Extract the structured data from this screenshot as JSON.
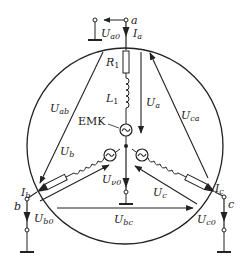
{
  "diagram": {
    "type": "three-phase star (wye) generator circuit",
    "colors": {
      "stroke": "#222222",
      "background": "#ffffff"
    },
    "nodes": {
      "a": {
        "label": "a"
      },
      "b": {
        "label": "b"
      },
      "c": {
        "label": "c"
      }
    },
    "components": {
      "resistor": {
        "label": "R",
        "sub": "1"
      },
      "inductor": {
        "label": "L",
        "sub": "1"
      },
      "emf": {
        "label": "EMK"
      }
    },
    "currents": {
      "Ia": {
        "main": "I",
        "sub": "a"
      },
      "Ib": {
        "main": "I",
        "sub": "b"
      },
      "Ic": {
        "main": "I",
        "sub": "c"
      }
    },
    "voltages": {
      "Ua0": {
        "main": "U",
        "sub": "a0"
      },
      "Ub0": {
        "main": "U",
        "sub": "b0"
      },
      "Uc0": {
        "main": "U",
        "sub": "c0"
      },
      "Un0": {
        "main": "U",
        "sub": "ν0"
      },
      "Ua": {
        "main": "U",
        "sub": "a"
      },
      "Ub": {
        "main": "U",
        "sub": "b"
      },
      "Uc": {
        "main": "U",
        "sub": "c"
      },
      "Uab": {
        "main": "U",
        "sub": "ab"
      },
      "Ubc": {
        "main": "U",
        "sub": "bc"
      },
      "Uca": {
        "main": "U",
        "sub": "ca"
      }
    }
  }
}
